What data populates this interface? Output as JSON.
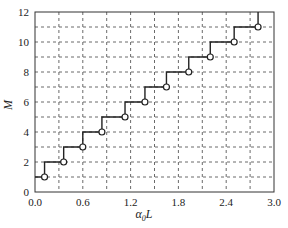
{
  "chart_data": {
    "type": "line",
    "title": "",
    "xlabel": "α₀L",
    "xlabel_main": "α",
    "xlabel_sub": "0",
    "xlabel_tail": "L",
    "ylabel": "M",
    "xlim": [
      0.0,
      3.0
    ],
    "ylim": [
      0,
      12
    ],
    "xticks": [
      "0.0",
      "0.6",
      "1.2",
      "1.8",
      "2.4",
      "3.0"
    ],
    "yticks": [
      "0",
      "2",
      "4",
      "6",
      "8",
      "10",
      "12"
    ],
    "grid": true,
    "grid_style": "dashed",
    "x_minor_grid_step": 0.3,
    "y_minor_grid_step": 1,
    "legend": "none",
    "series": [
      {
        "name": "M vs α0L (staircase)",
        "style": "step",
        "markers": "open-circle",
        "x": [
          0.12,
          0.36,
          0.6,
          0.84,
          1.13,
          1.38,
          1.65,
          1.93,
          2.2,
          2.5,
          2.8
        ],
        "y": [
          1,
          2,
          3,
          4,
          5,
          6,
          7,
          8,
          9,
          10,
          11
        ]
      }
    ]
  }
}
